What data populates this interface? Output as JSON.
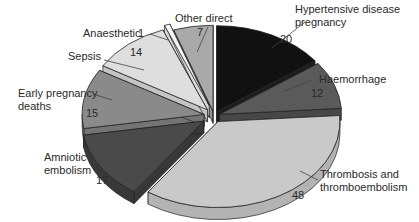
{
  "chart_data": {
    "type": "pie",
    "style": "3d-exploded",
    "title": "",
    "total": 134,
    "slices": [
      {
        "label": "Hypertensive disease pregnancy",
        "label_lines": [
          "Hypertensive disease",
          "pregnancy"
        ],
        "value": 20,
        "color": "#111111",
        "side": "#1c1c1c"
      },
      {
        "label": "Haemorrhage",
        "label_lines": [
          "Haemorrhage"
        ],
        "value": 12,
        "color": "#5a5a5a",
        "side": "#474747"
      },
      {
        "label": "Thrombosis and thromboembolism",
        "label_lines": [
          "Thrombosis and",
          "thromboembolism"
        ],
        "value": 48,
        "color": "#c9c9c9",
        "side": "#b3b3b3"
      },
      {
        "label": "Amniotic embolism",
        "label_lines": [
          "Amniotic",
          "embolism"
        ],
        "value": 17,
        "color": "#4a4a4a",
        "side": "#383838"
      },
      {
        "label": "Early pregnancy deaths",
        "label_lines": [
          "Early pregnancy",
          "deaths"
        ],
        "value": 15,
        "color": "#8a8a8a",
        "side": "#747474"
      },
      {
        "label": "Sepsis",
        "label_lines": [
          "Sepsis"
        ],
        "value": 14,
        "color": "#dedede",
        "side": "#c4c4c4"
      },
      {
        "label": "Anaesthetic",
        "label_lines": [
          "Anaesthetic"
        ],
        "value": 1,
        "color": "#f4f4f4",
        "side": "#d8d8d8"
      },
      {
        "label": "Other direct",
        "label_lines": [
          "Other direct"
        ],
        "value": 7,
        "color": "#a9a9a9",
        "side": "#949494"
      }
    ],
    "legend": "none (callout labels)"
  },
  "labels": {
    "hypertensive_1": "Hypertensive disease",
    "hypertensive_2": "pregnancy",
    "hypertensive_val": "20",
    "haemorrhage": "Haemorrhage",
    "haemorrhage_val": "12",
    "thrombosis_1": "Thrombosis and",
    "thrombosis_2": "thromboembolism",
    "thrombosis_val": "48",
    "amniotic_1": "Amniotic",
    "amniotic_2": "embolism",
    "amniotic_val": "17",
    "early_1": "Early pregnancy",
    "early_2": "deaths",
    "early_val": "15",
    "sepsis": "Sepsis",
    "sepsis_val": "14",
    "anaesthetic": "Anaesthetic",
    "anaesthetic_val": "1",
    "other": "Other direct",
    "other_val": "7"
  }
}
